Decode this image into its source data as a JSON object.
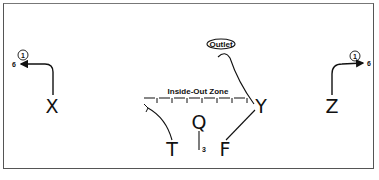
{
  "diagram": {
    "type": "football-play",
    "zone_label": "Inside-Out Zone",
    "outlet_label": "Outlet",
    "players": [
      {
        "label": "X",
        "x": 52,
        "y": 112
      },
      {
        "label": "Q",
        "x": 200,
        "y": 130
      },
      {
        "label": "Y",
        "x": 260,
        "y": 112
      },
      {
        "label": "Z",
        "x": 332,
        "y": 112
      },
      {
        "label": "T",
        "x": 172,
        "y": 155
      },
      {
        "label": "F",
        "x": 225,
        "y": 155
      }
    ],
    "route_annotations": {
      "x_read": "1",
      "x_depth": "6",
      "z_read": "1",
      "z_depth": "6",
      "q_drop": "3"
    }
  }
}
